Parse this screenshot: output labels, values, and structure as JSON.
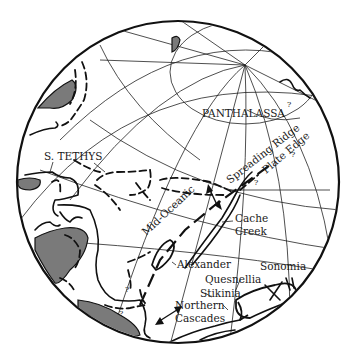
{
  "map": {
    "type": "paleogeographic globe projection",
    "labels": {
      "panthalassa": "PANTHALASSA",
      "s_tethys": "S. TETHYS",
      "spreading_ridge": "Spreading Ridge",
      "plate_edge": "Plate Edge",
      "mid_oceanic": "Mid-Oceanic",
      "cache": "Cache",
      "creek": "Creek",
      "alexander": "Alexander",
      "quesnellia": "Quesnellia",
      "sonomia": "Sonomia",
      "stikinia": "Stikinia",
      "northern": "Northern",
      "cascades": "Cascades"
    },
    "uncertainty_marks": [
      "?",
      "?",
      "?",
      "?",
      "?",
      "?"
    ],
    "colors": {
      "land_fill": "#7a7a7a",
      "line": "#111111",
      "background": "#ffffff"
    }
  }
}
